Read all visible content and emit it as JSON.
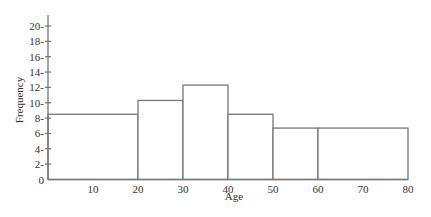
{
  "chart_data": {
    "type": "bar",
    "subtype": "histogram",
    "title": "",
    "xlabel": "Age",
    "ylabel": "Frequency",
    "bins": [
      {
        "start": 0,
        "end": 20,
        "value": 8.5
      },
      {
        "start": 20,
        "end": 30,
        "value": 10.3
      },
      {
        "start": 30,
        "end": 40,
        "value": 12.3
      },
      {
        "start": 40,
        "end": 50,
        "value": 8.5
      },
      {
        "start": 50,
        "end": 60,
        "value": 6.7
      },
      {
        "start": 60,
        "end": 80,
        "value": 6.7
      }
    ],
    "categories": [
      "0-20",
      "20-30",
      "30-40",
      "40-50",
      "50-60",
      "60-80"
    ],
    "values": [
      8.5,
      10.3,
      12.3,
      8.5,
      6.7,
      6.7
    ],
    "xlim": [
      0,
      80
    ],
    "ylim": [
      0,
      20
    ],
    "x_tick_labels": [
      "10",
      "20",
      "30",
      "40",
      "50",
      "60",
      "70",
      "80"
    ],
    "x_tick_values": [
      10,
      20,
      30,
      40,
      50,
      60,
      70,
      80
    ],
    "y_tick_labels": [
      "0",
      "2-",
      "4-",
      "6-",
      "8-",
      "10-",
      "12-",
      "14-",
      "16-",
      "18-",
      "20-"
    ],
    "y_tick_values": [
      0,
      2,
      4,
      6,
      8,
      10,
      12,
      14,
      16,
      18,
      20
    ],
    "grid": false,
    "legend": null,
    "colors": {
      "line": "#777777",
      "text": "#333333",
      "fill": "#ffffff"
    }
  }
}
